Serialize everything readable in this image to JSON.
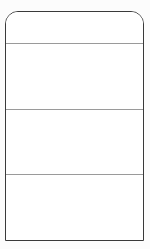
{
  "document": {
    "kind": "blank-sectioned-form-template",
    "title": "",
    "background_color": "#fcfcfc",
    "page_color": "#ffffff",
    "border_color": "#3a3a3a",
    "divider_color": "#9a9a9a",
    "corner_style_top": "rounded",
    "corner_style_bottom": "square",
    "corner_radius_px": 13,
    "border_width_px": 1.5,
    "divider_width_px": 1,
    "width_px": 150,
    "height_px": 249
  },
  "card": {
    "panels": [
      {
        "name": "header-panel",
        "label": "",
        "height_px": 31,
        "has_top_rule": false
      },
      {
        "name": "section-1",
        "label": "",
        "height_px": 65,
        "has_top_rule": true
      },
      {
        "name": "section-2",
        "label": "",
        "height_px": 65,
        "has_top_rule": true
      },
      {
        "name": "section-3",
        "label": "",
        "height_px": 66,
        "has_top_rule": true
      }
    ],
    "divider_positions_px": [
      43,
      108,
      174
    ]
  }
}
